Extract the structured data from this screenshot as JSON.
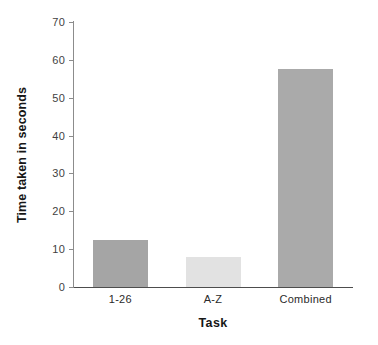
{
  "chart_data": {
    "type": "bar",
    "title": "",
    "xlabel": "Task",
    "ylabel": "Time taken in seconds",
    "categories": [
      "1-26",
      "A-Z",
      "Combined"
    ],
    "values": [
      12.3,
      8.0,
      57.5
    ],
    "bar_colors": [
      "#a5a5a5",
      "#e2e2e2",
      "#aaaaaa"
    ],
    "ylim": [
      0,
      70
    ],
    "yticks": [
      0,
      10,
      20,
      30,
      40,
      50,
      60,
      70
    ],
    "ytick_labels": [
      "0",
      "10",
      "20",
      "30",
      "40",
      "50",
      "60",
      "70"
    ],
    "grid": false,
    "legend": false,
    "spines": [
      "left",
      "bottom"
    ],
    "background": "#ffffff"
  }
}
